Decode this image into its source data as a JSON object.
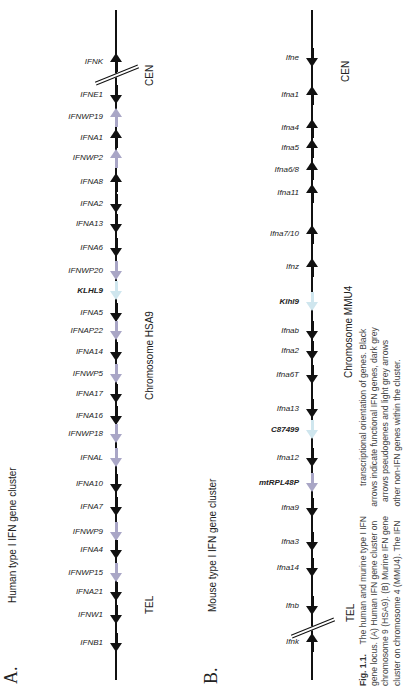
{
  "figure": {
    "caption_label": "Fig. 1.1.",
    "caption_lines": [
      "The human and murine type I IFN",
      "gene locus. (A) Human IFN gene cluster on",
      "chromosome 9 (HSA9). (B) Murine IFN gene",
      "cluster on chromosome 4 (MMU4). The IFN",
      "transcriptional orientation of genes. Black",
      "arrows indicate functional IFN genes, dark grey",
      "arrows pseudogenes and light grey arrows",
      "other non-IFN genes within the cluster."
    ],
    "colors": {
      "functional": "#111111",
      "pseudogene": "#a9a6c6",
      "non_ifn": "#cfe6ee"
    }
  },
  "panel_a": {
    "letter": "A.",
    "title": "Human type I IFN gene cluster",
    "chromosome_label": "Chromosome HSA9",
    "cen_label": "CEN",
    "tel_label": "TEL",
    "genes": [
      {
        "name": "IFNK",
        "dir": "up",
        "type": "functional",
        "y": 62
      },
      {
        "name": "IFNE1",
        "dir": "down",
        "type": "functional",
        "y": 95
      },
      {
        "name": "IFNWP19",
        "dir": "up",
        "type": "pseudogene",
        "y": 117
      },
      {
        "name": "IFNA1",
        "dir": "up",
        "type": "functional",
        "y": 138
      },
      {
        "name": "IFNWP2",
        "dir": "up",
        "type": "pseudogene",
        "y": 158
      },
      {
        "name": "IFNA8",
        "dir": "up",
        "type": "functional",
        "y": 182
      },
      {
        "name": "IFNA2",
        "dir": "down",
        "type": "functional",
        "y": 204
      },
      {
        "name": "IFNA13",
        "dir": "down",
        "type": "functional",
        "y": 224
      },
      {
        "name": "IFNA6",
        "dir": "down",
        "type": "functional",
        "y": 248
      },
      {
        "name": "IFNWP20",
        "dir": "down",
        "type": "pseudogene",
        "y": 271
      },
      {
        "name": "KLHL9",
        "dir": "down",
        "type": "non_ifn",
        "y": 291,
        "bold": true
      },
      {
        "name": "IFNA5",
        "dir": "down",
        "type": "functional",
        "y": 313
      },
      {
        "name": "IFNAP22",
        "dir": "down",
        "type": "pseudogene",
        "y": 331
      },
      {
        "name": "IFNA14",
        "dir": "down",
        "type": "functional",
        "y": 352
      },
      {
        "name": "IFNWP5",
        "dir": "down",
        "type": "pseudogene",
        "y": 374
      },
      {
        "name": "IFNA17",
        "dir": "down",
        "type": "functional",
        "y": 394
      },
      {
        "name": "IFNA16",
        "dir": "down",
        "type": "functional",
        "y": 416
      },
      {
        "name": "IFNWP18",
        "dir": "down",
        "type": "pseudogene",
        "y": 434
      },
      {
        "name": "IFNAL",
        "dir": "down",
        "type": "pseudogene",
        "y": 458
      },
      {
        "name": "IFNA10",
        "dir": "down",
        "type": "functional",
        "y": 484
      },
      {
        "name": "IFNA7",
        "dir": "down",
        "type": "functional",
        "y": 507
      },
      {
        "name": "IFNWP9",
        "dir": "down",
        "type": "pseudogene",
        "y": 532
      },
      {
        "name": "IFNA4",
        "dir": "down",
        "type": "functional",
        "y": 550
      },
      {
        "name": "IFNWP15",
        "dir": "down",
        "type": "pseudogene",
        "y": 573
      },
      {
        "name": "IFNA21",
        "dir": "down",
        "type": "functional",
        "y": 592
      },
      {
        "name": "IFNW1",
        "dir": "down",
        "type": "functional",
        "y": 615
      },
      {
        "name": "IFNB1",
        "dir": "down",
        "type": "functional",
        "y": 643
      }
    ]
  },
  "panel_b": {
    "letter": "B.",
    "title": "Mouse type I IFN gene cluster",
    "chromosome_label": "Chromosome MMU4",
    "cen_label": "CEN",
    "tel_label": "TEL",
    "genes": [
      {
        "name": "Ifne",
        "dir": "down",
        "type": "functional",
        "y": 58
      },
      {
        "name": "Ifna1",
        "dir": "up",
        "type": "functional",
        "y": 95
      },
      {
        "name": "Ifna4",
        "dir": "up",
        "type": "functional",
        "y": 128
      },
      {
        "name": "Ifna5",
        "dir": "up",
        "type": "functional",
        "y": 148
      },
      {
        "name": "Ifna6/8",
        "dir": "up",
        "type": "functional",
        "y": 170
      },
      {
        "name": "Ifna11",
        "dir": "up",
        "type": "functional",
        "y": 193
      },
      {
        "name": "Ifna7/10",
        "dir": "up",
        "type": "functional",
        "y": 234
      },
      {
        "name": "Ifnz",
        "dir": "up",
        "type": "functional",
        "y": 267
      },
      {
        "name": "Klhl9",
        "dir": "down",
        "type": "non_ifn",
        "y": 302,
        "bold": true
      },
      {
        "name": "Ifnab",
        "dir": "down",
        "type": "functional",
        "y": 331
      },
      {
        "name": "Ifna2",
        "dir": "down",
        "type": "functional",
        "y": 351
      },
      {
        "name": "Ifna6T",
        "dir": "down",
        "type": "functional",
        "y": 375
      },
      {
        "name": "Ifna13",
        "dir": "down",
        "type": "functional",
        "y": 409
      },
      {
        "name": "C87499",
        "dir": "down",
        "type": "non_ifn",
        "y": 430,
        "bold": true
      },
      {
        "name": "Ifna12",
        "dir": "down",
        "type": "functional",
        "y": 458
      },
      {
        "name": "mtRPL48P",
        "dir": "down",
        "type": "pseudogene",
        "y": 483,
        "bold": true
      },
      {
        "name": "Ifna9",
        "dir": "down",
        "type": "functional",
        "y": 508
      },
      {
        "name": "Ifna3",
        "dir": "down",
        "type": "functional",
        "y": 542
      },
      {
        "name": "Ifna14",
        "dir": "down",
        "type": "functional",
        "y": 568
      },
      {
        "name": "Ifnb",
        "dir": "down",
        "type": "functional",
        "y": 606
      },
      {
        "name": "Ifnk",
        "dir": "up",
        "type": "functional",
        "y": 642
      }
    ]
  }
}
